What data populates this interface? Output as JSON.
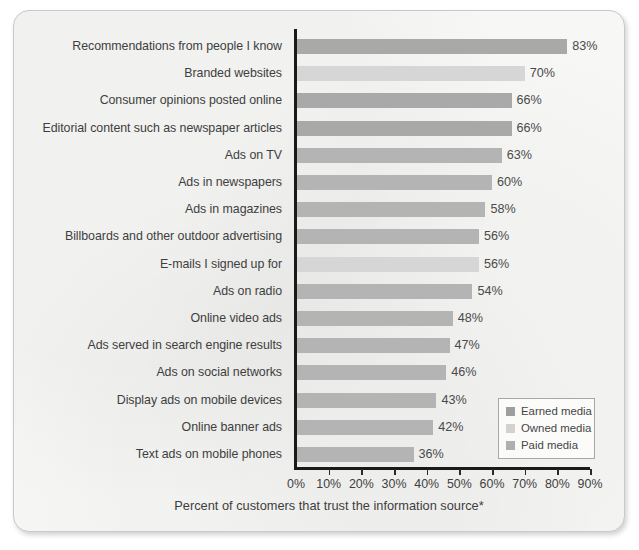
{
  "chart_data": {
    "type": "bar",
    "orientation": "horizontal",
    "title": "",
    "xlabel": "Percent of customers that trust the information source*",
    "ylabel": "",
    "xlim": [
      0,
      90
    ],
    "xtick_labels": [
      "0%",
      "10%",
      "20%",
      "30%",
      "40%",
      "50%",
      "60%",
      "70%",
      "80%",
      "90%"
    ],
    "xtick_values": [
      0,
      10,
      20,
      30,
      40,
      50,
      60,
      70,
      80,
      90
    ],
    "grid": false,
    "legend_position": "lower-right",
    "categories": [
      "Recommendations from people I know",
      "Branded websites",
      "Consumer opinions posted online",
      "Editorial content such as newspaper articles",
      "Ads on TV",
      "Ads in newspapers",
      "Ads in magazines",
      "Billboards and other outdoor advertising",
      "E-mails I signed up for",
      "Ads on radio",
      "Online video ads",
      "Ads served in search engine results",
      "Ads on social networks",
      "Display ads on mobile devices",
      "Online banner ads",
      "Text ads on mobile phones"
    ],
    "values": [
      83,
      70,
      66,
      66,
      63,
      60,
      58,
      56,
      56,
      54,
      48,
      47,
      46,
      43,
      42,
      36
    ],
    "value_labels": [
      "83%",
      "70%",
      "66%",
      "66%",
      "63%",
      "60%",
      "58%",
      "56%",
      "56%",
      "54%",
      "48%",
      "47%",
      "46%",
      "43%",
      "42%",
      "36%"
    ],
    "series_of_bar": [
      "earned",
      "owned",
      "earned",
      "earned",
      "paid",
      "paid",
      "paid",
      "paid",
      "owned",
      "paid",
      "paid",
      "paid",
      "paid",
      "paid",
      "paid",
      "paid"
    ],
    "legend": [
      {
        "key": "earned",
        "label": "Earned media",
        "color": "#9e9e9e"
      },
      {
        "key": "owned",
        "label": "Owned media",
        "color": "#d2d2d2"
      },
      {
        "key": "paid",
        "label": "Paid media",
        "color": "#afafaf"
      }
    ]
  },
  "colors": {
    "earned_media": "#a9a9a9",
    "owned_media": "#d6d6d6",
    "paid_media": "#b4b4b4",
    "axis": "#1a1a1a",
    "text": "#3e3e3e",
    "card_background": "#f7f7f5"
  }
}
